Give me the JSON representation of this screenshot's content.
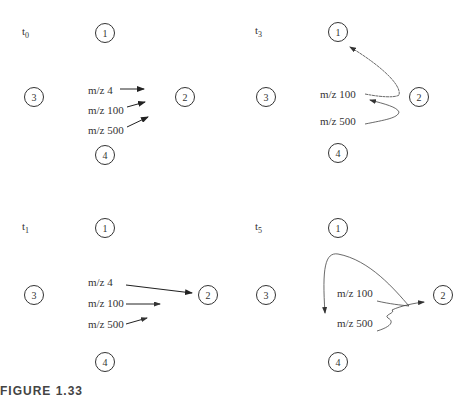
{
  "figure": {
    "caption_partial": "FIGURE 1.33",
    "panels": [
      {
        "id": "t0",
        "time_label": "t",
        "time_sub": "0",
        "ions": [
          "m/z 4",
          "m/z 100",
          "m/z 500"
        ],
        "nodes": [
          "1",
          "2",
          "3",
          "4"
        ]
      },
      {
        "id": "t3",
        "time_label": "t",
        "time_sub": "3",
        "ions": [
          "m/z 100",
          "m/z 500"
        ],
        "nodes": [
          "1",
          "2",
          "3",
          "4"
        ]
      },
      {
        "id": "t1",
        "time_label": "t",
        "time_sub": "1",
        "ions": [
          "m/z 4",
          "m/z 100",
          "m/z 500"
        ],
        "nodes": [
          "1",
          "2",
          "3",
          "4"
        ]
      },
      {
        "id": "t5",
        "time_label": "t",
        "time_sub": "5",
        "ions": [
          "m/z 100",
          "m/z 500"
        ],
        "nodes": [
          "1",
          "2",
          "3",
          "4"
        ]
      }
    ]
  }
}
